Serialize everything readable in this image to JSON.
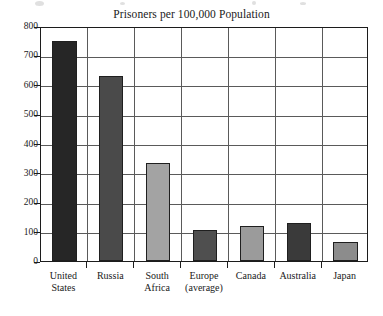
{
  "chart_data": {
    "type": "bar",
    "title": "Prisoners per 100,000 Population",
    "xlabel": "",
    "ylabel": "",
    "ylim": [
      0,
      800
    ],
    "yticks": [
      0,
      100,
      200,
      300,
      400,
      500,
      600,
      700,
      800
    ],
    "ytick_labels": [
      "0",
      "100",
      "200",
      "300",
      "400",
      "500",
      "600",
      "700",
      "800"
    ],
    "grid": "horizontal-and-vertical",
    "legend": "none",
    "categories": [
      "United States",
      "Russia",
      "South Africa",
      "Europe (average)",
      "Canada",
      "Australia",
      "Japan"
    ],
    "category_lines": [
      [
        "United",
        "States"
      ],
      [
        "Russia",
        ""
      ],
      [
        "South",
        "Africa"
      ],
      [
        "Europe",
        "(average)"
      ],
      [
        "Canada",
        ""
      ],
      [
        "Australia",
        ""
      ],
      [
        "Japan",
        ""
      ]
    ],
    "values": [
      750,
      630,
      333,
      107,
      118,
      128,
      65
    ],
    "bar_colors": [
      "#262626",
      "#4a4a4a",
      "#a3a3a3",
      "#4f4f4f",
      "#9b9b9b",
      "#3a3a3a",
      "#8c8c8c"
    ],
    "bar_edge_color": "#1f1f1f",
    "grid_color": "#5a5a5a",
    "frame_color": "#1c1c1c",
    "background_color": "#ffffff"
  }
}
